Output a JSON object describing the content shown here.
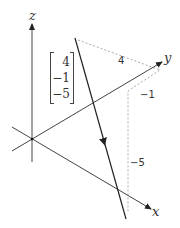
{
  "diagram": {
    "type": "3d-vector-components",
    "axes": {
      "x_label": "x",
      "y_label": "y",
      "z_label": "z"
    },
    "vector": {
      "components": [
        "4",
        "-1",
        "-5"
      ],
      "display_components": [
        "4",
        "−1",
        "−5"
      ]
    },
    "component_path_labels": {
      "x_component": "4",
      "y_component": "−1",
      "z_component": "−5"
    },
    "colors": {
      "axis": "#555555",
      "vector": "#222222",
      "dashed": "#aaaaaa",
      "text": "#333333"
    }
  }
}
